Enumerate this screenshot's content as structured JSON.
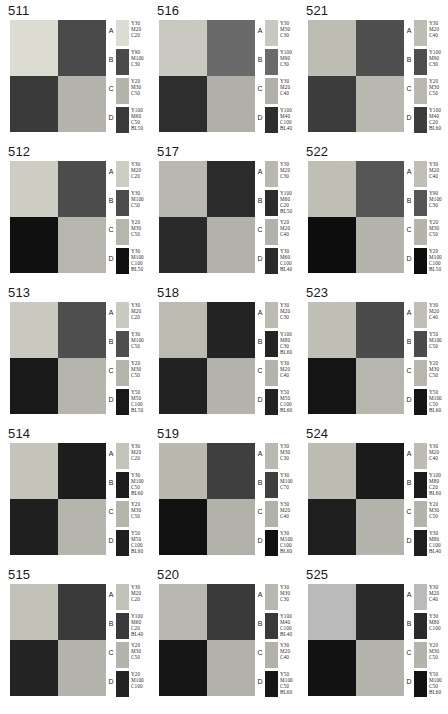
{
  "sheet": {
    "columns": 3,
    "rows": 5,
    "letters": [
      "A",
      "B",
      "C",
      "D"
    ]
  },
  "panels": [
    {
      "id": "511",
      "quadrants": {
        "top_left": "#dcdcd2",
        "top_right": "#4a4a4a",
        "bottom_left": "#3a3a3a",
        "bottom_right": "#b4b4ac"
      },
      "swatches": [
        {
          "letter": "A",
          "color": "#dcdcd2",
          "inks": [
            "Y30",
            "M20",
            "C20"
          ]
        },
        {
          "letter": "B",
          "color": "#4a4a4a",
          "inks": [
            "Y90",
            "M100",
            "C30"
          ]
        },
        {
          "letter": "C",
          "color": "#b4b4ac",
          "inks": [
            "Y20",
            "M30",
            "C50"
          ]
        },
        {
          "letter": "D",
          "color": "#3a3a3a",
          "inks": [
            "Y100",
            "M60",
            "C50",
            "BL50"
          ]
        }
      ]
    },
    {
      "id": "516",
      "quadrants": {
        "top_left": "#c8c8c0",
        "top_right": "#6a6a6a",
        "bottom_left": "#2e2e2e",
        "bottom_right": "#b0b0a8"
      },
      "swatches": [
        {
          "letter": "A",
          "color": "#c8c8c0",
          "inks": [
            "Y30",
            "M30",
            "C30"
          ]
        },
        {
          "letter": "B",
          "color": "#6a6a6a",
          "inks": [
            "Y100",
            "M90",
            "C30"
          ]
        },
        {
          "letter": "C",
          "color": "#b0b0a8",
          "inks": [
            "Y30",
            "M20",
            "C40"
          ]
        },
        {
          "letter": "D",
          "color": "#2e2e2e",
          "inks": [
            "Y100",
            "M40",
            "C100",
            "BL40"
          ]
        }
      ]
    },
    {
      "id": "521",
      "quadrants": {
        "top_left": "#bdbdb4",
        "top_right": "#4e4e4e",
        "bottom_left": "#3c3c3c",
        "bottom_right": "#b8b8b0"
      },
      "swatches": [
        {
          "letter": "A",
          "color": "#bdbdb4",
          "inks": [
            "Y30",
            "M20",
            "C40"
          ]
        },
        {
          "letter": "B",
          "color": "#4e4e4e",
          "inks": [
            "Y100",
            "M90",
            "C30"
          ]
        },
        {
          "letter": "C",
          "color": "#b8b8b0",
          "inks": [
            "Y20",
            "M30",
            "C50"
          ]
        },
        {
          "letter": "D",
          "color": "#3c3c3c",
          "inks": [
            "Y100",
            "M40",
            "C20",
            "BL60"
          ]
        }
      ]
    },
    {
      "id": "512",
      "quadrants": {
        "top_left": "#cdcdc4",
        "top_right": "#4c4c4c",
        "bottom_left": "#101010",
        "bottom_right": "#b6b6ae"
      },
      "swatches": [
        {
          "letter": "A",
          "color": "#cdcdc4",
          "inks": [
            "Y30",
            "M20",
            "C20"
          ]
        },
        {
          "letter": "B",
          "color": "#4c4c4c",
          "inks": [
            "Y30",
            "M100",
            "C50"
          ]
        },
        {
          "letter": "C",
          "color": "#b6b6ae",
          "inks": [
            "Y20",
            "M30",
            "C50"
          ]
        },
        {
          "letter": "D",
          "color": "#101010",
          "inks": [
            "Y30",
            "M100",
            "C100",
            "BL50"
          ]
        }
      ]
    },
    {
      "id": "517",
      "quadrants": {
        "top_left": "#b8b8b0",
        "top_right": "#2c2c2c",
        "bottom_left": "#2a2a2a",
        "bottom_right": "#b2b2aa"
      },
      "swatches": [
        {
          "letter": "A",
          "color": "#b8b8b0",
          "inks": [
            "Y30",
            "M20",
            "C30"
          ]
        },
        {
          "letter": "B",
          "color": "#2c2c2c",
          "inks": [
            "Y100",
            "M60",
            "C20",
            "BL50"
          ]
        },
        {
          "letter": "C",
          "color": "#b2b2aa",
          "inks": [
            "Y20",
            "M20",
            "C40"
          ]
        },
        {
          "letter": "D",
          "color": "#2a2a2a",
          "inks": [
            "Y30",
            "M60",
            "C100",
            "BL40"
          ]
        }
      ]
    },
    {
      "id": "522",
      "quadrants": {
        "top_left": "#bfbfb6",
        "top_right": "#555555",
        "bottom_left": "#0d0d0d",
        "bottom_right": "#b4b4ac"
      },
      "swatches": [
        {
          "letter": "A",
          "color": "#bfbfb6",
          "inks": [
            "Y30",
            "M20",
            "C40"
          ]
        },
        {
          "letter": "B",
          "color": "#555555",
          "inks": [
            "Y90",
            "M100",
            "C30"
          ]
        },
        {
          "letter": "C",
          "color": "#b4b4ac",
          "inks": [
            "Y20",
            "M30",
            "C50"
          ]
        },
        {
          "letter": "D",
          "color": "#0d0d0d",
          "inks": [
            "Y20",
            "M100",
            "C100",
            "BL50"
          ]
        }
      ]
    },
    {
      "id": "513",
      "quadrants": {
        "top_left": "#c9c9c0",
        "top_right": "#4e4e4e",
        "bottom_left": "#191919",
        "bottom_right": "#b5b5ad"
      },
      "swatches": [
        {
          "letter": "A",
          "color": "#c9c9c0",
          "inks": [
            "Y30",
            "M20",
            "C20"
          ]
        },
        {
          "letter": "B",
          "color": "#4e4e4e",
          "inks": [
            "Y30",
            "M100",
            "C50"
          ]
        },
        {
          "letter": "C",
          "color": "#b5b5ad",
          "inks": [
            "Y20",
            "M30",
            "C50"
          ]
        },
        {
          "letter": "D",
          "color": "#191919",
          "inks": [
            "Y50",
            "M50",
            "C100",
            "BL50"
          ]
        }
      ]
    },
    {
      "id": "518",
      "quadrants": {
        "top_left": "#bbbbb2",
        "top_right": "#242424",
        "bottom_left": "#222222",
        "bottom_right": "#b3b3ab"
      },
      "swatches": [
        {
          "letter": "A",
          "color": "#bbbbb2",
          "inks": [
            "Y30",
            "M20",
            "C30"
          ]
        },
        {
          "letter": "B",
          "color": "#242424",
          "inks": [
            "Y100",
            "M80",
            "C30",
            "BL60"
          ]
        },
        {
          "letter": "C",
          "color": "#b3b3ab",
          "inks": [
            "Y30",
            "M20",
            "C40"
          ]
        },
        {
          "letter": "D",
          "color": "#222222",
          "inks": [
            "Y50",
            "M50",
            "C100",
            "BL60"
          ]
        }
      ]
    },
    {
      "id": "523",
      "quadrants": {
        "top_left": "#bfbfb6",
        "top_right": "#4b4b4b",
        "bottom_left": "#141414",
        "bottom_right": "#b6b6ae"
      },
      "swatches": [
        {
          "letter": "A",
          "color": "#bfbfb6",
          "inks": [
            "Y30",
            "M20",
            "C40"
          ]
        },
        {
          "letter": "B",
          "color": "#4b4b4b",
          "inks": [
            "Y50",
            "M100",
            "C50"
          ]
        },
        {
          "letter": "C",
          "color": "#b6b6ae",
          "inks": [
            "Y20",
            "M30",
            "C50"
          ]
        },
        {
          "letter": "D",
          "color": "#141414",
          "inks": [
            "Y50",
            "M100",
            "C50",
            "BL60"
          ]
        }
      ]
    },
    {
      "id": "514",
      "quadrants": {
        "top_left": "#c4c4bb",
        "top_right": "#1d1d1d",
        "bottom_left": "#1f1f1f",
        "bottom_right": "#b5b5ad"
      },
      "swatches": [
        {
          "letter": "A",
          "color": "#c4c4bb",
          "inks": [
            "Y30",
            "M20",
            "C20"
          ]
        },
        {
          "letter": "B",
          "color": "#1d1d1d",
          "inks": [
            "Y30",
            "M100",
            "C50",
            "BL60"
          ]
        },
        {
          "letter": "C",
          "color": "#b5b5ad",
          "inks": [
            "Y20",
            "M30",
            "C50"
          ]
        },
        {
          "letter": "D",
          "color": "#1f1f1f",
          "inks": [
            "Y50",
            "M50",
            "C100",
            "BL60"
          ]
        }
      ]
    },
    {
      "id": "519",
      "quadrants": {
        "top_left": "#b9b9b0",
        "top_right": "#3f3f3f",
        "bottom_left": "#111111",
        "bottom_right": "#b2b2aa"
      },
      "swatches": [
        {
          "letter": "A",
          "color": "#b9b9b0",
          "inks": [
            "Y30",
            "M30",
            "C30"
          ]
        },
        {
          "letter": "B",
          "color": "#3f3f3f",
          "inks": [
            "Y30",
            "M100",
            "C70"
          ]
        },
        {
          "letter": "C",
          "color": "#b2b2aa",
          "inks": [
            "Y30",
            "M20",
            "C40"
          ]
        },
        {
          "letter": "D",
          "color": "#111111",
          "inks": [
            "Y30",
            "M100",
            "C100",
            "BL60"
          ]
        }
      ]
    },
    {
      "id": "524",
      "quadrants": {
        "top_left": "#bcbcb3",
        "top_right": "#1b1b1b",
        "bottom_left": "#1e1e1e",
        "bottom_right": "#b4b4ac"
      },
      "swatches": [
        {
          "letter": "A",
          "color": "#bcbcb3",
          "inks": [
            "Y30",
            "M20",
            "C40"
          ]
        },
        {
          "letter": "B",
          "color": "#1b1b1b",
          "inks": [
            "Y100",
            "M80",
            "C20",
            "BL60"
          ]
        },
        {
          "letter": "C",
          "color": "#b4b4ac",
          "inks": [
            "Y20",
            "M30",
            "C50"
          ]
        },
        {
          "letter": "D",
          "color": "#1e1e1e",
          "inks": [
            "Y30",
            "M80",
            "C100",
            "BL40"
          ]
        }
      ]
    },
    {
      "id": "515",
      "quadrants": {
        "top_left": "#c2c2b9",
        "top_right": "#3a3a3a",
        "bottom_left": "#242424",
        "bottom_right": "#b4b4ac"
      },
      "swatches": [
        {
          "letter": "A",
          "color": "#c2c2b9",
          "inks": [
            "Y30",
            "M20",
            "C20"
          ]
        },
        {
          "letter": "B",
          "color": "#3a3a3a",
          "inks": [
            "Y100",
            "M60",
            "C20",
            "BL40"
          ]
        },
        {
          "letter": "C",
          "color": "#b4b4ac",
          "inks": [
            "Y20",
            "M30",
            "C50"
          ]
        },
        {
          "letter": "D",
          "color": "#242424",
          "inks": [
            "Y20",
            "M100",
            "C100"
          ]
        }
      ]
    },
    {
      "id": "520",
      "quadrants": {
        "top_left": "#b8b8b0",
        "top_right": "#3a3a3a",
        "bottom_left": "#161616",
        "bottom_right": "#b2b2aa"
      },
      "swatches": [
        {
          "letter": "A",
          "color": "#b8b8b0",
          "inks": [
            "Y30",
            "M30",
            "C30"
          ]
        },
        {
          "letter": "B",
          "color": "#3a3a3a",
          "inks": [
            "Y100",
            "M40",
            "C100",
            "BL40"
          ]
        },
        {
          "letter": "C",
          "color": "#b2b2aa",
          "inks": [
            "Y30",
            "M20",
            "C40"
          ]
        },
        {
          "letter": "D",
          "color": "#161616",
          "inks": [
            "Y50",
            "M100",
            "C50",
            "BL60"
          ]
        }
      ]
    },
    {
      "id": "525",
      "quadrants": {
        "top_left": "#bababa",
        "top_right": "#2a2a2a",
        "bottom_left": "#121212",
        "bottom_right": "#b4b4ac"
      },
      "swatches": [
        {
          "letter": "A",
          "color": "#bababa",
          "inks": [
            "Y30",
            "M20",
            "C40"
          ]
        },
        {
          "letter": "B",
          "color": "#2a2a2a",
          "inks": [
            "Y30",
            "M80",
            "C100"
          ]
        },
        {
          "letter": "C",
          "color": "#b4b4ac",
          "inks": [
            "Y20",
            "M30",
            "C50"
          ]
        },
        {
          "letter": "D",
          "color": "#121212",
          "inks": [
            "Y50",
            "M100",
            "C50",
            "BL60"
          ]
        }
      ]
    }
  ]
}
